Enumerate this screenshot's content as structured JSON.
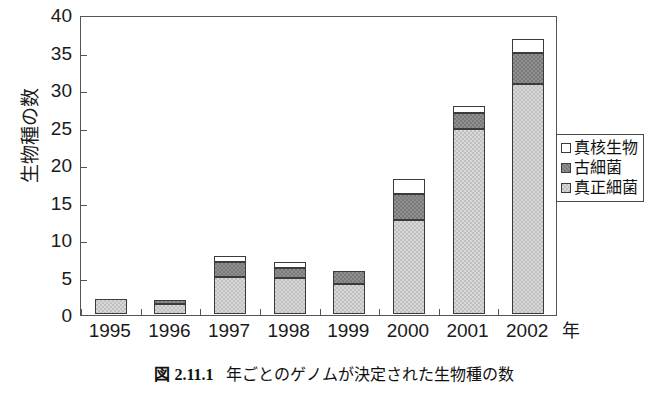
{
  "chart_data": {
    "type": "bar",
    "stacked": true,
    "title": "",
    "xlabel": "年",
    "ylabel": "生物種の数",
    "categories": [
      "1995",
      "1996",
      "1997",
      "1998",
      "1999",
      "2000",
      "2001",
      "2002"
    ],
    "ylim": [
      0,
      40
    ],
    "yticks": [
      0,
      5,
      10,
      15,
      20,
      25,
      30,
      35,
      40
    ],
    "ytick_labels": [
      "0",
      "5",
      "10",
      "15",
      "20",
      "25",
      "30",
      "35",
      "40"
    ],
    "grid": false,
    "legend_position": "right",
    "series": [
      {
        "name": "真正細菌",
        "color": "#c0c0c0",
        "values": [
          2.0,
          1.3,
          5.0,
          4.8,
          4.0,
          12.5,
          24.7,
          30.7
        ]
      },
      {
        "name": "古細菌",
        "color": "#7a7a7a",
        "values": [
          0.0,
          0.6,
          2.0,
          1.3,
          1.8,
          3.5,
          2.1,
          4.1
        ]
      },
      {
        "name": "真核生物",
        "color": "#ffffff",
        "values": [
          0.0,
          0.0,
          0.7,
          0.9,
          0.0,
          2.0,
          1.0,
          1.9
        ]
      }
    ],
    "totals": [
      2.0,
      1.9,
      7.7,
      7.0,
      5.8,
      18.0,
      27.8,
      36.7
    ]
  },
  "legend": {
    "items": [
      {
        "label": "真核生物",
        "swatch": "eukaryote"
      },
      {
        "label": "古細菌",
        "swatch": "archaea"
      },
      {
        "label": "真正細菌",
        "swatch": "bacteria"
      }
    ]
  },
  "caption": {
    "number": "図 2.11.1",
    "text": "年ごとのゲノムが決定された生物種の数"
  }
}
